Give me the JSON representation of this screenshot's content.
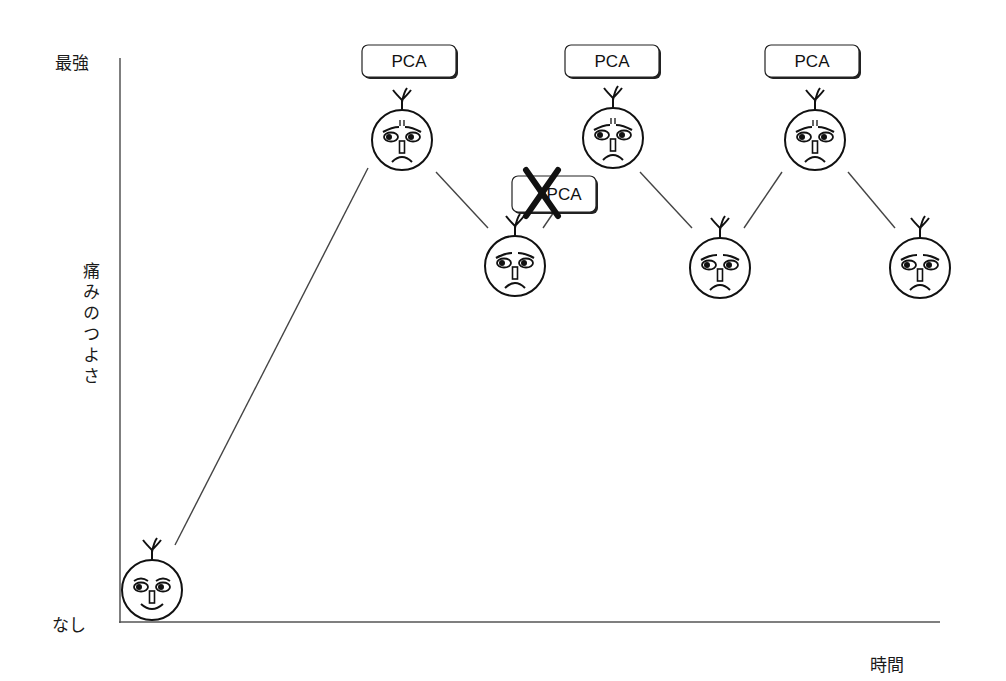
{
  "chart_data": {
    "type": "line",
    "title": "",
    "xlabel": "時間",
    "ylabel": "痛みのつよさ",
    "y_tick_labels": {
      "top": "最強",
      "bottom": "なし"
    },
    "grid": false,
    "legend": null,
    "x": [
      0,
      1,
      2,
      3,
      4,
      5,
      6
    ],
    "series": [
      {
        "name": "痛みのつよさ",
        "values": [
          0,
          85,
          62,
          85,
          62,
          85,
          62
        ],
        "faces": [
          "happy",
          "pain",
          "moderate",
          "pain",
          "moderate",
          "pain",
          "moderate"
        ]
      }
    ],
    "ylim": [
      0,
      100
    ],
    "annotations": [
      {
        "text": "PCA",
        "at_point": 1,
        "crossed": false
      },
      {
        "text": "PCA",
        "at_point": 2,
        "crossed": true
      },
      {
        "text": "PCA",
        "at_point": 3,
        "crossed": false
      },
      {
        "text": "PCA",
        "at_point": 5,
        "crossed": false
      }
    ]
  },
  "labels": {
    "y_top": "最強",
    "y_bottom": "なし",
    "y_axis": "痛みのつよさ",
    "x_axis": "時間",
    "pca": "PCA"
  },
  "layout": {
    "axis_color": "#555555",
    "line_color": "#444444",
    "face_stroke": "#111111",
    "faces": [
      {
        "cx": 152,
        "cy": 590,
        "mood": "happy"
      },
      {
        "cx": 402,
        "cy": 140,
        "mood": "pain"
      },
      {
        "cx": 515,
        "cy": 266,
        "mood": "moderate"
      },
      {
        "cx": 613,
        "cy": 138,
        "mood": "pain"
      },
      {
        "cx": 720,
        "cy": 268,
        "mood": "moderate"
      },
      {
        "cx": 815,
        "cy": 140,
        "mood": "pain"
      },
      {
        "cx": 920,
        "cy": 268,
        "mood": "moderate"
      }
    ],
    "segments": [
      [
        175,
        545,
        368,
        168
      ],
      [
        436,
        172,
        488,
        228
      ],
      [
        543,
        228,
        558,
        206
      ],
      [
        640,
        172,
        692,
        228
      ],
      [
        744,
        228,
        782,
        172
      ],
      [
        848,
        172,
        895,
        228
      ]
    ],
    "pca_boxes": [
      {
        "x": 362,
        "y": 45,
        "w": 94,
        "h": 32,
        "crossed": false
      },
      {
        "x": 512,
        "y": 176,
        "w": 84,
        "h": 36,
        "crossed": true
      },
      {
        "x": 565,
        "y": 45,
        "w": 94,
        "h": 32,
        "crossed": false
      },
      {
        "x": 765,
        "y": 45,
        "w": 94,
        "h": 32,
        "crossed": false
      }
    ]
  }
}
